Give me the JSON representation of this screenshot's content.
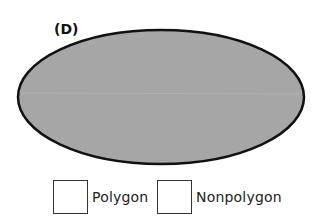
{
  "figure": {
    "label": "(D)",
    "shape": {
      "type": "ellipse",
      "fill_color": "#a6a6a6",
      "stroke_color": "#111111"
    }
  },
  "options": [
    {
      "label": "Polygon",
      "checked": false
    },
    {
      "label": "Nonpolygon",
      "checked": false
    }
  ]
}
